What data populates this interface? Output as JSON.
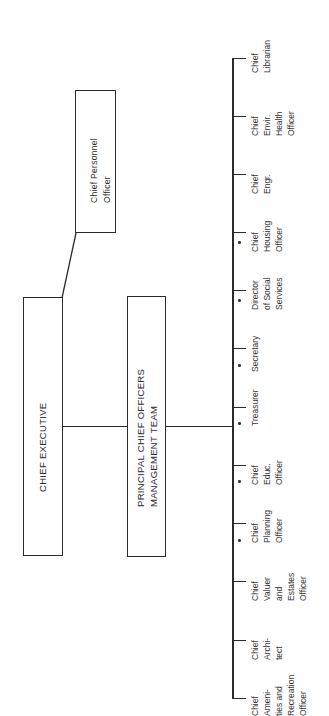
{
  "header": {
    "fragment": ""
  },
  "boxes": {
    "chief_executive": "CHIEF EXECUTIVE",
    "chief_personnel_officer": [
      "Chief Personnel",
      "Officer"
    ],
    "principal_team": [
      "PRINCIPAL CHIEF OFFICERS",
      "MANAGEMENT TEAM"
    ]
  },
  "officers": [
    {
      "lines": [
        "Chief",
        "Librarian"
      ],
      "dot": false
    },
    {
      "lines": [
        "Chief",
        "Envir.",
        "Health",
        "Officer"
      ],
      "dot": false
    },
    {
      "lines": [
        "Chief",
        "Engr."
      ],
      "dot": false
    },
    {
      "lines": [
        "Chief",
        "Housing",
        "Officer"
      ],
      "dot": true
    },
    {
      "lines": [
        "Director",
        "of Social",
        "Services"
      ],
      "dot": true
    },
    {
      "lines": [
        "Secretary"
      ],
      "dot": true
    },
    {
      "lines": [
        "Treasurer"
      ],
      "dot": true
    },
    {
      "lines": [
        "Chief",
        "Educ.",
        "Officer"
      ],
      "dot": true
    },
    {
      "lines": [
        "Chief",
        "Planning",
        "Officer"
      ],
      "dot": true
    },
    {
      "lines": [
        "Chief",
        "Valuer",
        "and",
        "Estates",
        "Officer"
      ],
      "dot": false
    },
    {
      "lines": [
        "Chief",
        "Archi-",
        "tect"
      ],
      "dot": false
    },
    {
      "lines": [
        "Chief",
        "Ameni-",
        "ties and",
        "Recreation",
        "Officer"
      ],
      "dot": false
    }
  ],
  "colors": {
    "ink": "#2b2b2b",
    "paper": "#ffffff"
  }
}
